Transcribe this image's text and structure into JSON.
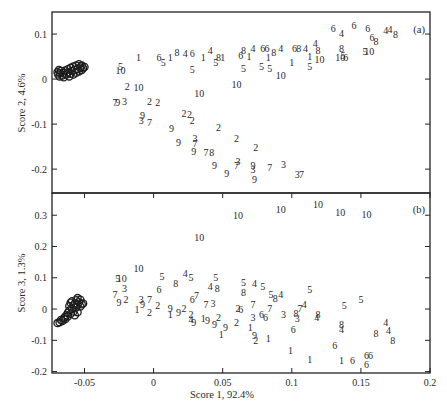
{
  "figure": {
    "ylabel_a": "Score 2, 4.6%",
    "ylabel_b": "Score 3, 1.3%",
    "xlabel": "Score 1, 92.4%",
    "tag_a": "(a)",
    "tag_b": "(b)"
  },
  "chart_data": {
    "type": "scatter",
    "title": "",
    "xlabel": "Score 1, 92.4%",
    "xlim": [
      -0.0735,
      0.2
    ],
    "xticks": [
      -0.05,
      0,
      0.05,
      0.1,
      0.15,
      0.2
    ],
    "xtick_labels": [
      "-0.05",
      "0",
      "0.05",
      "0.1",
      "0.15",
      "0.2"
    ],
    "grid": false,
    "legend": null,
    "marker_note": "Numbered text labels (1-10) mark samples; open circles mark a dense reference cluster near x=-0.06",
    "panels": [
      {
        "tag": "(a)",
        "ylabel": "Score 2, 4.6%",
        "ylim": [
          -0.253,
          0.149
        ],
        "yticks": [
          0.1,
          0,
          -0.1,
          -0.2
        ],
        "ytick_labels": [
          "0.1",
          "0",
          "-0.1",
          "-0.2"
        ],
        "circles": [
          [
            -0.0695,
            0.015
          ],
          [
            -0.069,
            0.01
          ],
          [
            -0.0685,
            0.02
          ],
          [
            -0.068,
            0.006
          ],
          [
            -0.0675,
            0.013
          ],
          [
            -0.067,
            0.018
          ],
          [
            -0.066,
            0.008
          ],
          [
            -0.065,
            0.014
          ],
          [
            -0.065,
            0.004
          ],
          [
            -0.064,
            0.019
          ],
          [
            -0.063,
            0.01
          ],
          [
            -0.062,
            0.015
          ],
          [
            -0.062,
            0.022
          ],
          [
            -0.061,
            0.006
          ],
          [
            -0.06,
            0.012
          ],
          [
            -0.06,
            0.025
          ],
          [
            -0.059,
            0.018
          ],
          [
            -0.058,
            0.01
          ],
          [
            -0.058,
            0.028
          ],
          [
            -0.057,
            0.02
          ],
          [
            -0.056,
            0.014
          ],
          [
            -0.056,
            0.03
          ],
          [
            -0.055,
            0.022
          ],
          [
            -0.054,
            0.017
          ],
          [
            -0.054,
            0.033
          ],
          [
            -0.053,
            0.026
          ],
          [
            -0.052,
            0.02
          ],
          [
            -0.052,
            0.03
          ],
          [
            -0.051,
            0.024
          ],
          [
            -0.05,
            0.027
          ]
        ],
        "points": [
          [
            "5",
            -0.024,
            0.029
          ],
          [
            "10",
            -0.024,
            0.018
          ],
          [
            "1",
            -0.011,
            0.047
          ],
          [
            "6",
            0.004,
            0.049
          ],
          [
            "5",
            0.007,
            0.036
          ],
          [
            "1",
            0.012,
            0.047
          ],
          [
            "8",
            0.017,
            0.058
          ],
          [
            "4",
            0.023,
            0.056
          ],
          [
            "6",
            0.028,
            0.056
          ],
          [
            "1",
            0.036,
            0.047
          ],
          [
            "4",
            0.041,
            0.064
          ],
          [
            "8",
            0.047,
            0.047
          ],
          [
            "5",
            0.045,
            0.036
          ],
          [
            "1",
            0.05,
            0.047
          ],
          [
            "5",
            0.028,
            0.022
          ],
          [
            "2",
            -0.019,
            -0.016
          ],
          [
            "10",
            -0.011,
            -0.018
          ],
          [
            "7",
            -0.028,
            -0.051
          ],
          [
            "9",
            -0.026,
            -0.051
          ],
          [
            "3",
            -0.021,
            -0.049
          ],
          [
            "2",
            -0.003,
            -0.049
          ],
          [
            "2",
            0.003,
            -0.051
          ],
          [
            "10",
            0.033,
            -0.031
          ],
          [
            "9",
            -0.008,
            -0.08
          ],
          [
            "3",
            -0.009,
            -0.093
          ],
          [
            "7",
            -0.003,
            -0.096
          ],
          [
            "2",
            0.022,
            -0.076
          ],
          [
            "2",
            0.026,
            -0.078
          ],
          [
            "2",
            0.028,
            -0.091
          ],
          [
            "9",
            0.013,
            -0.109
          ],
          [
            "2",
            0.047,
            -0.107
          ],
          [
            "9",
            0.018,
            -0.14
          ],
          [
            "3",
            0.03,
            -0.131
          ],
          [
            "7",
            0.03,
            -0.142
          ],
          [
            "2",
            0.06,
            -0.131
          ],
          [
            "9",
            0.029,
            -0.16
          ],
          [
            "7",
            0.038,
            -0.164
          ],
          [
            "8",
            0.042,
            -0.162
          ],
          [
            "2",
            0.074,
            -0.151
          ],
          [
            "9",
            0.044,
            -0.193
          ],
          [
            "3",
            0.061,
            -0.182
          ],
          [
            "7",
            0.06,
            -0.191
          ],
          [
            "9",
            0.053,
            -0.209
          ],
          [
            "9",
            0.072,
            -0.191
          ],
          [
            "3",
            0.072,
            -0.2
          ],
          [
            "7",
            0.084,
            -0.196
          ],
          [
            "9",
            0.073,
            -0.224
          ],
          [
            "3",
            0.094,
            -0.189
          ],
          [
            "3",
            0.104,
            -0.211
          ],
          [
            "7",
            0.107,
            -0.213
          ],
          [
            "6",
            0.063,
            0.053
          ],
          [
            "8",
            0.065,
            0.064
          ],
          [
            "1",
            0.069,
            0.051
          ],
          [
            "4",
            0.072,
            0.067
          ],
          [
            "6",
            0.079,
            0.069
          ],
          [
            "6",
            0.082,
            0.069
          ],
          [
            "1",
            0.083,
            0.047
          ],
          [
            "8",
            0.087,
            0.058
          ],
          [
            "4",
            0.092,
            0.069
          ],
          [
            "6",
            0.102,
            0.069
          ],
          [
            "8",
            0.105,
            0.069
          ],
          [
            "4",
            0.11,
            0.069
          ],
          [
            "4",
            0.117,
            0.078
          ],
          [
            "8",
            0.119,
            0.064
          ],
          [
            "1",
            0.113,
            0.051
          ],
          [
            "10",
            0.12,
            0.044
          ],
          [
            "5",
            0.065,
            0.024
          ],
          [
            "5",
            0.078,
            0.027
          ],
          [
            "5",
            0.084,
            0.024
          ],
          [
            "10",
            0.092,
            0.009
          ],
          [
            "1",
            0.1,
            0.036
          ],
          [
            "5",
            0.113,
            0.029
          ],
          [
            "10",
            0.135,
            0.047
          ],
          [
            "8",
            0.136,
            0.069
          ],
          [
            "5",
            0.137,
            0.053
          ],
          [
            "6",
            0.139,
            0.049
          ],
          [
            "5",
            0.153,
            0.062
          ],
          [
            "10",
            0.156,
            0.062
          ],
          [
            "6",
            0.13,
            0.113
          ],
          [
            "4",
            0.136,
            0.102
          ],
          [
            "6",
            0.145,
            0.118
          ],
          [
            "6",
            0.155,
            0.113
          ],
          [
            "6",
            0.158,
            0.093
          ],
          [
            "8",
            0.161,
            0.084
          ],
          [
            "4",
            0.168,
            0.107
          ],
          [
            "4",
            0.171,
            0.111
          ],
          [
            "8",
            0.175,
            0.098
          ],
          [
            "10",
            0.06,
            -0.013
          ]
        ]
      },
      {
        "tag": "(b)",
        "ylabel": "Score 3, 1.3%",
        "ylim": [
          -0.2045,
          0.371
        ],
        "yticks": [
          0.3,
          0.2,
          0.1,
          0,
          -0.1,
          -0.2
        ],
        "ytick_labels": [
          "0.3",
          "0.2",
          "0.1",
          "0",
          "-0.1",
          "-0.2"
        ],
        "circles": [
          [
            -0.0695,
            -0.045
          ],
          [
            -0.068,
            -0.042
          ],
          [
            -0.067,
            -0.035
          ],
          [
            -0.066,
            -0.038
          ],
          [
            -0.065,
            -0.03
          ],
          [
            -0.064,
            -0.025
          ],
          [
            -0.064,
            -0.033
          ],
          [
            -0.063,
            -0.02
          ],
          [
            -0.062,
            -0.012
          ],
          [
            -0.062,
            -0.024
          ],
          [
            -0.061,
            -0.005
          ],
          [
            -0.061,
            0.01
          ],
          [
            -0.06,
            0.02
          ],
          [
            -0.06,
            -0.015
          ],
          [
            -0.059,
            0.0
          ],
          [
            -0.059,
            0.025
          ],
          [
            -0.058,
            0.012
          ],
          [
            -0.058,
            -0.008
          ],
          [
            -0.057,
            0.018
          ],
          [
            -0.057,
            -0.02
          ],
          [
            -0.056,
            0.005
          ],
          [
            -0.056,
            0.028
          ],
          [
            -0.055,
            -0.01
          ],
          [
            -0.055,
            0.015
          ],
          [
            -0.054,
            0.022
          ],
          [
            -0.053,
            0.008
          ],
          [
            -0.053,
            0.03
          ],
          [
            -0.052,
            0.015
          ],
          [
            -0.051,
            0.018
          ],
          [
            -0.055,
            0.035
          ]
        ],
        "points": [
          [
            "10",
            -0.011,
            0.131
          ],
          [
            "5",
            -0.026,
            0.099
          ],
          [
            "10",
            -0.023,
            0.099
          ],
          [
            "5",
            0.006,
            0.105
          ],
          [
            "4",
            0.023,
            0.115
          ],
          [
            "5",
            0.027,
            0.102
          ],
          [
            "8",
            0.016,
            0.083
          ],
          [
            "5",
            0.045,
            0.102
          ],
          [
            "4",
            0.041,
            0.073
          ],
          [
            "8",
            0.046,
            0.067
          ],
          [
            "3",
            -0.021,
            0.067
          ],
          [
            "6",
            0.004,
            0.061
          ],
          [
            "7",
            -0.028,
            0.048
          ],
          [
            "9",
            -0.025,
            0.022
          ],
          [
            "2",
            -0.02,
            0.032
          ],
          [
            "3",
            -0.009,
            0.032
          ],
          [
            "9",
            -0.008,
            0.016
          ],
          [
            "7",
            -0.003,
            0.032
          ],
          [
            "1",
            -0.012,
            -0.003
          ],
          [
            "2",
            -0.003,
            -0.01
          ],
          [
            "2",
            0.003,
            0.01
          ],
          [
            "9",
            0.012,
            0.003
          ],
          [
            "1",
            0.012,
            -0.019
          ],
          [
            "9",
            0.018,
            -0.01
          ],
          [
            "2",
            0.022,
            0.003
          ],
          [
            "6",
            0.028,
            0.029
          ],
          [
            "7",
            0.031,
            0.042
          ],
          [
            "7",
            0.038,
            0.016
          ],
          [
            "3",
            0.043,
            0.019
          ],
          [
            "2",
            0.027,
            -0.016
          ],
          [
            "9",
            0.029,
            -0.042
          ],
          [
            "4",
            0.027,
            -0.032
          ],
          [
            "1",
            0.036,
            -0.029
          ],
          [
            "9",
            0.039,
            -0.038
          ],
          [
            "9",
            0.044,
            -0.051
          ],
          [
            "2",
            0.047,
            -0.026
          ],
          [
            "1",
            0.049,
            -0.08
          ],
          [
            "9",
            0.052,
            -0.058
          ],
          [
            "5",
            0.065,
            0.086
          ],
          [
            "4",
            0.073,
            0.083
          ],
          [
            "5",
            0.079,
            0.073
          ],
          [
            "8",
            0.065,
            0.054
          ],
          [
            "5",
            0.085,
            0.048
          ],
          [
            "8",
            0.088,
            0.035
          ],
          [
            "4",
            0.092,
            0.048
          ],
          [
            "5",
            0.113,
            0.064
          ],
          [
            "2",
            0.061,
            0.003
          ],
          [
            "6",
            0.063,
            0.0
          ],
          [
            "7",
            0.072,
            0.013
          ],
          [
            "7",
            0.084,
            0.003
          ],
          [
            "3",
            0.072,
            -0.026
          ],
          [
            "6",
            0.078,
            -0.016
          ],
          [
            "6",
            0.081,
            -0.026
          ],
          [
            "3",
            0.094,
            -0.016
          ],
          [
            "8",
            0.103,
            -0.013
          ],
          [
            "7",
            0.106,
            0.003
          ],
          [
            "4",
            0.109,
            0.016
          ],
          [
            "3",
            0.104,
            -0.029
          ],
          [
            "4",
            0.118,
            -0.026
          ],
          [
            "8",
            0.119,
            -0.016
          ],
          [
            "2",
            0.06,
            -0.042
          ],
          [
            "1",
            0.07,
            -0.058
          ],
          [
            "6",
            0.101,
            -0.067
          ],
          [
            "9",
            0.073,
            -0.086
          ],
          [
            "2",
            0.074,
            -0.099
          ],
          [
            "1",
            0.083,
            -0.093
          ],
          [
            "1",
            0.099,
            -0.134
          ],
          [
            "1",
            0.113,
            -0.16
          ],
          [
            "6",
            0.131,
            -0.115
          ],
          [
            "5",
            0.138,
            0.01
          ],
          [
            "5",
            0.15,
            0.029
          ],
          [
            "8",
            0.136,
            -0.051
          ],
          [
            "4",
            0.136,
            -0.064
          ],
          [
            "4",
            0.168,
            -0.042
          ],
          [
            "4",
            0.17,
            -0.07
          ],
          [
            "8",
            0.173,
            -0.099
          ],
          [
            "8",
            0.161,
            -0.077
          ],
          [
            "1",
            0.136,
            -0.166
          ],
          [
            "6",
            0.144,
            -0.166
          ],
          [
            "6",
            0.154,
            -0.15
          ],
          [
            "6",
            0.157,
            -0.15
          ],
          [
            "6",
            0.154,
            -0.176
          ],
          [
            "10",
            0.033,
            0.23
          ],
          [
            "10",
            0.061,
            0.3
          ],
          [
            "10",
            0.092,
            0.319
          ],
          [
            "10",
            0.119,
            0.335
          ],
          [
            "10",
            0.135,
            0.31
          ],
          [
            "10",
            0.154,
            0.303
          ]
        ]
      }
    ]
  }
}
